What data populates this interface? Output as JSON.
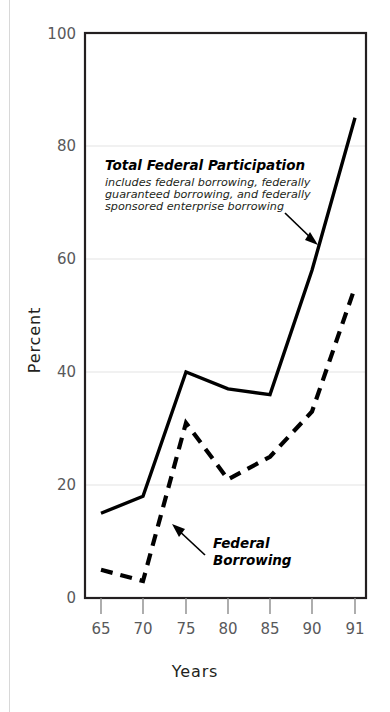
{
  "chart_data": {
    "type": "line",
    "title": "",
    "xlabel": "Years",
    "ylabel": "Percent",
    "categories": [
      "65",
      "70",
      "75",
      "80",
      "85",
      "90",
      "91"
    ],
    "x_tick_labels": [
      "65",
      "70",
      "75",
      "80",
      "85",
      "90",
      "91"
    ],
    "y_tick_labels": [
      "0",
      "20",
      "40",
      "60",
      "80",
      "100"
    ],
    "y_ticks": [
      0,
      20,
      40,
      60,
      80,
      100
    ],
    "ylim": [
      0,
      100
    ],
    "grid": "horizontal",
    "legend": "annotations",
    "series": [
      {
        "name": "Total Federal Participation",
        "style": "solid",
        "color": "#000000",
        "values": [
          15,
          18,
          40,
          37,
          36,
          58,
          85
        ]
      },
      {
        "name": "Federal Borrowing",
        "style": "dashed",
        "color": "#000000",
        "values": [
          5,
          3,
          31,
          21,
          25,
          33,
          55
        ]
      }
    ],
    "annotations": [
      {
        "id": "total-federal-participation",
        "heading": "Total Federal Participation",
        "lines": [
          "includes federal borrowing, federally",
          "guaranteed borrowing, and federally",
          "sponsored enterprise borrowing"
        ],
        "arrow": "points-to-solid-line"
      },
      {
        "id": "federal-borrowing",
        "heading_lines": [
          "Federal",
          "Borrowing"
        ],
        "heading": "Federal Borrowing",
        "arrow": "points-to-dashed-line"
      }
    ]
  },
  "colors": {
    "axis": "#231f20",
    "gridline": "#ededed",
    "tick_text": "#58595b",
    "line": "#000000",
    "background": "#ffffff"
  }
}
